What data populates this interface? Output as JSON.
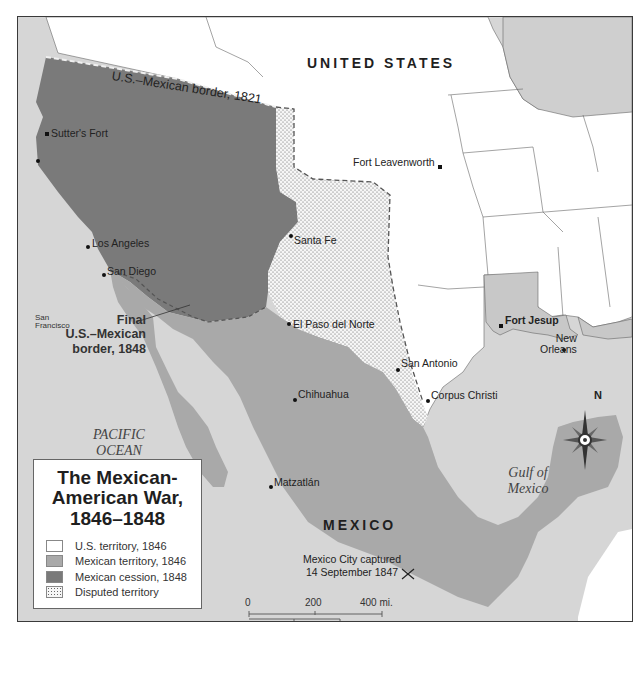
{
  "title": {
    "line1": "The Mexican-",
    "line2": "American War,",
    "line3": "1846–1848"
  },
  "legend": {
    "items": [
      {
        "label": "U.S. territory, 1846",
        "color": "#ffffff",
        "pattern": "solid"
      },
      {
        "label": "Mexican territory, 1846",
        "color": "#a9a9a9",
        "pattern": "solid"
      },
      {
        "label": "Mexican cession, 1848",
        "color": "#7a7a7a",
        "pattern": "solid"
      },
      {
        "label": "Disputed territory",
        "color": "#f4f4f4",
        "pattern": "dotted"
      }
    ]
  },
  "regions": {
    "us": "UNITED STATES",
    "mexico": "MEXICO"
  },
  "water": {
    "pacific_line1": "PACIFIC",
    "pacific_line2": "OCEAN",
    "gulf_line1": "Gulf of",
    "gulf_line2": "Mexico"
  },
  "borders": {
    "border_1821": "U.S.–Mexican border, 1821",
    "final_line1": "Final",
    "final_line2": "U.S.–Mexican",
    "final_line3": "border, 1848"
  },
  "places": {
    "sutters_fort": "Sutter's Fort",
    "san_francisco_line1": "San",
    "san_francisco_line2": "Francisco",
    "los_angeles": "Los Angeles",
    "san_diego": "San Diego",
    "santa_fe": "Santa Fe",
    "el_paso": "El Paso del Norte",
    "fort_leavenworth": "Fort Leavenworth",
    "fort_jesup": "Fort Jesup",
    "new_orleans_line1": "New",
    "new_orleans_line2": "Orleans",
    "san_antonio": "San Antonio",
    "corpus_christi": "Corpus Christi",
    "chihuahua": "Chihuahua",
    "matzatlan": "Matzatlán"
  },
  "events": {
    "mexico_city_line1": "Mexico City captured",
    "mexico_city_line2": "14 September 1847"
  },
  "scale": {
    "mi_0": "0",
    "mi_200": "200",
    "mi_400": "400 mi.",
    "km_0": "0",
    "km_200": "200",
    "km_400": "400 km"
  },
  "compass": {
    "north": "N"
  },
  "colors": {
    "us_territory": "#ffffff",
    "mexican_territory": "#a9a9a9",
    "mexican_cession": "#7a7a7a",
    "water": "#d6d6d6",
    "disputed": "#f4f4f4"
  }
}
